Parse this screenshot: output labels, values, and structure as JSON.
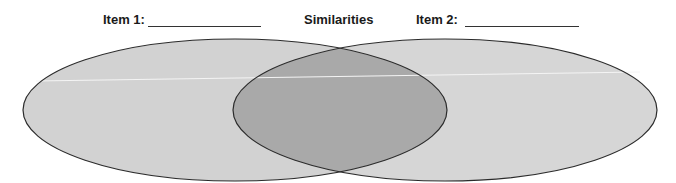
{
  "diagram": {
    "type": "venn",
    "labels": {
      "left": "Item 1:",
      "center": "Similarities",
      "right": "Item 2:"
    },
    "left_blank": "",
    "right_blank": "",
    "colors": {
      "circle_fill": "#d2d2d2",
      "overlap_fill": "#a9a9a9",
      "stroke": "#2b2b2b"
    }
  }
}
